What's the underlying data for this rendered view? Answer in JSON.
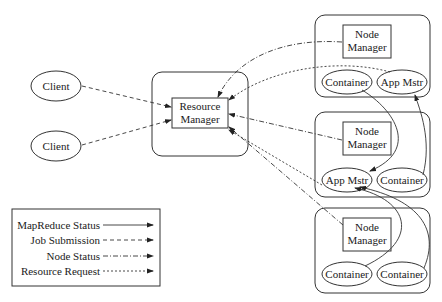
{
  "clients": [
    {
      "label": "Client"
    },
    {
      "label": "Client"
    }
  ],
  "resource_manager": {
    "label_line1": "Resource",
    "label_line2": "Manager"
  },
  "nodes": [
    {
      "nm_line1": "Node",
      "nm_line2": "Manager",
      "left": "Container",
      "right": "App Mstr"
    },
    {
      "nm_line1": "Node",
      "nm_line2": "Manager",
      "left": "App Mstr",
      "right": "Container"
    },
    {
      "nm_line1": "Node",
      "nm_line2": "Manager",
      "left": "Container",
      "right": "Container"
    }
  ],
  "legend": {
    "items": [
      {
        "label": "MapReduce Status",
        "style": "solid"
      },
      {
        "label": "Job Submission",
        "style": "dashed"
      },
      {
        "label": "Node Status",
        "style": "dash-dot"
      },
      {
        "label": "Resource Request",
        "style": "dotted"
      }
    ]
  },
  "colors": {
    "stroke": "#333333",
    "background": "#ffffff"
  }
}
